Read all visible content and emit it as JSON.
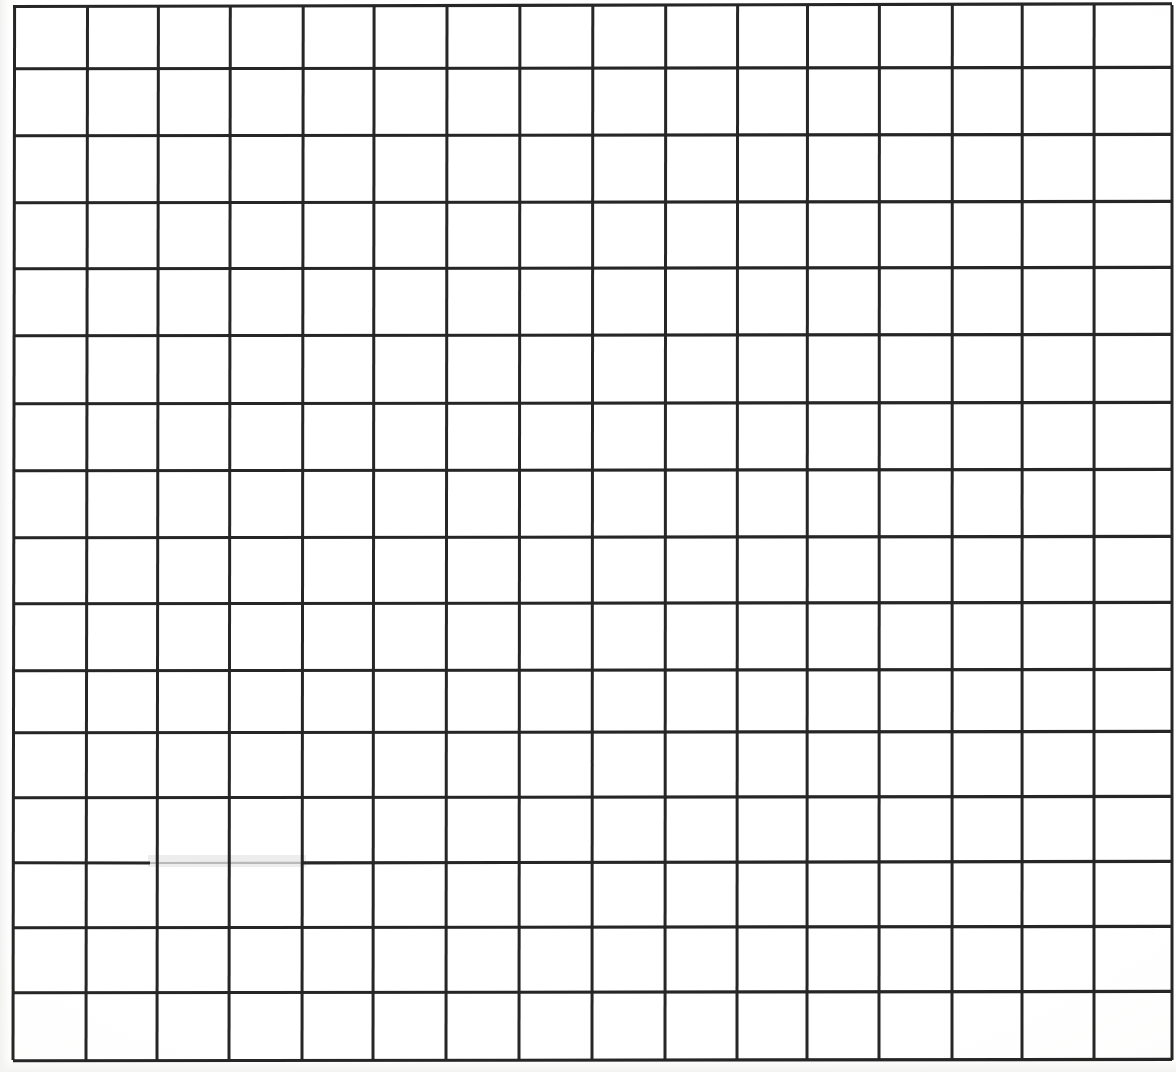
{
  "document": {
    "kind": "scanned-grid-sheet",
    "title": "Blank grid sheet (scanned)",
    "description": "A scanned sheet of blank graph paper: a hand/printer drawn rectangular grid of 16 columns by 16 rows in dark ink on white paper. No text, labels, numbers, annotations or marks are present anywhere on the page.",
    "page_width": 1176,
    "page_height": 1072,
    "background_color": "#ffffff",
    "ink_color": "#262626",
    "faded_ink_color": "#b9b9b9",
    "text_content": "",
    "annotations": []
  },
  "chart_data": {
    "type": "table",
    "title": "",
    "subtitle": "",
    "xlabel": "",
    "ylabel": "",
    "grid": true,
    "legend_position": "none",
    "columns": 16,
    "rows": 16,
    "column_headers": [],
    "row_headers": [],
    "cells": [],
    "vertical_line_x": [
      13,
      86,
      157,
      229,
      302,
      373,
      446,
      519,
      592,
      665,
      737,
      807,
      879,
      952,
      1022,
      1094,
      1172
    ],
    "horizontal_line_y": [
      5,
      68,
      135,
      202,
      268,
      335,
      403,
      470,
      537,
      603,
      670,
      732,
      797,
      862,
      927,
      992,
      1060
    ],
    "cell_width_avg": 72,
    "cell_height_avg": 66,
    "defects": [
      {
        "name": "faded-line-segment",
        "line": "horizontal",
        "line_index": 13,
        "y": 862,
        "x_start": 150,
        "x_end": 302,
        "description": "Horizontal grid line is faint / partially erased with a light grey smudge."
      }
    ]
  }
}
